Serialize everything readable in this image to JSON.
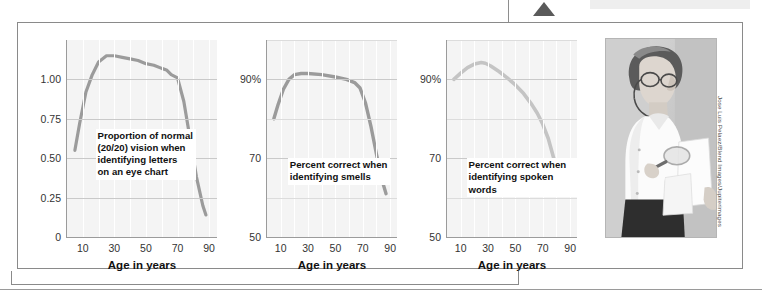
{
  "figure": {
    "background_color": "#ffffff",
    "frame_color": "#8a8a8a",
    "pointer_icon": "triangle-pointer-icon"
  },
  "photo": {
    "alt_name": "elderly-woman-with-magnifying-glass-photo",
    "credit": "Jose Luis Pelaez/Blend Images/Jupiterimages"
  },
  "chart_data": [
    {
      "type": "line",
      "panel_index": 1,
      "title": "",
      "annotation": "Proportion of normal\n(20/20) vision when\nidentifying letters\non an eye chart",
      "annotation_lines": [
        "Proportion of normal",
        "(20/20) vision when",
        "identifying letters",
        "on an eye chart"
      ],
      "xlabel": "Age in years",
      "ylabel": "",
      "line_color": "#9b9b9b",
      "plot_background": "#f4f4f4",
      "grid": true,
      "xlim": [
        0,
        95
      ],
      "ylim": [
        0,
        1.25
      ],
      "xticks": [
        10,
        30,
        50,
        70,
        90
      ],
      "xticklabels": [
        "10",
        "30",
        "50",
        "70",
        "90"
      ],
      "yticks": [
        0,
        0.25,
        0.5,
        0.75,
        1.0
      ],
      "yticklabels": [
        "0",
        "0.25",
        "0.50",
        "0.75",
        "1.00"
      ],
      "x": [
        5,
        8,
        12,
        16,
        20,
        25,
        30,
        35,
        40,
        45,
        50,
        55,
        60,
        63,
        66,
        70,
        74,
        78,
        82,
        86,
        88
      ],
      "y": [
        0.55,
        0.72,
        0.92,
        1.03,
        1.11,
        1.15,
        1.15,
        1.14,
        1.13,
        1.12,
        1.1,
        1.09,
        1.07,
        1.06,
        1.03,
        1.01,
        0.86,
        0.62,
        0.38,
        0.2,
        0.14
      ]
    },
    {
      "type": "line",
      "panel_index": 2,
      "title": "",
      "annotation": "Percent correct when\nidentifying smells",
      "annotation_lines": [
        "Percent correct when",
        "identifying smells"
      ],
      "xlabel": "Age in years",
      "ylabel": "",
      "line_color": "#9b9b9b",
      "plot_background": "#f4f4f4",
      "grid": true,
      "xlim": [
        0,
        95
      ],
      "ylim": [
        50,
        100
      ],
      "xticks": [
        10,
        30,
        50,
        70,
        90
      ],
      "xticklabels": [
        "10",
        "30",
        "50",
        "70",
        "90"
      ],
      "yticks": [
        50,
        70,
        90
      ],
      "yticklabels": [
        "50",
        "70",
        "90%"
      ],
      "x": [
        5,
        8,
        12,
        16,
        20,
        25,
        30,
        40,
        50,
        58,
        64,
        68,
        72,
        76,
        80,
        84,
        87
      ],
      "y": [
        80.0,
        83.5,
        87.5,
        90.0,
        91.2,
        91.5,
        91.5,
        91.2,
        90.6,
        90.0,
        89.2,
        87.8,
        84.0,
        78.0,
        71.0,
        64.5,
        61.0
      ]
    },
    {
      "type": "line",
      "panel_index": 3,
      "title": "",
      "annotation": "Percent correct when\nidentifying spoken words",
      "annotation_lines": [
        "Percent correct when",
        "identifying spoken words"
      ],
      "xlabel": "Age in years",
      "ylabel": "",
      "line_color": "#c4c4c4",
      "plot_background": "#f4f4f4",
      "grid": true,
      "xlim": [
        0,
        95
      ],
      "ylim": [
        50,
        100
      ],
      "xticks": [
        10,
        30,
        50,
        70,
        90
      ],
      "xticklabels": [
        "10",
        "30",
        "50",
        "70",
        "90"
      ],
      "yticks": [
        50,
        70,
        90
      ],
      "yticklabels": [
        "50",
        "70",
        "90%"
      ],
      "x": [
        5,
        10,
        15,
        20,
        25,
        28,
        32,
        38,
        44,
        50,
        56,
        62,
        66,
        70,
        74,
        78,
        81,
        83
      ],
      "y": [
        90.0,
        91.6,
        93.0,
        93.9,
        94.3,
        94.1,
        93.4,
        92.0,
        90.4,
        88.6,
        86.4,
        83.6,
        81.4,
        78.6,
        75.0,
        70.0,
        65.5,
        62.5
      ]
    }
  ],
  "panels": [
    {
      "annotation_lines": [
        "Proportion of normal",
        "(20/20) vision when",
        "identifying letters",
        "on an eye chart"
      ],
      "xlabel": "Age in years",
      "xticklabels": [
        "10",
        "30",
        "50",
        "70",
        "90"
      ],
      "yticklabels": [
        "0",
        "0.25",
        "0.50",
        "0.75",
        "1.00"
      ]
    },
    {
      "annotation_lines": [
        "Percent correct when",
        "identifying smells"
      ],
      "xlabel": "Age in years",
      "xticklabels": [
        "10",
        "30",
        "50",
        "70",
        "90"
      ],
      "yticklabels": [
        "50",
        "70",
        "90%"
      ]
    },
    {
      "annotation_lines": [
        "Percent correct when",
        "identifying spoken words"
      ],
      "xlabel": "Age in years",
      "xticklabels": [
        "10",
        "30",
        "50",
        "70",
        "90"
      ],
      "yticklabels": [
        "50",
        "70",
        "90%"
      ]
    }
  ]
}
